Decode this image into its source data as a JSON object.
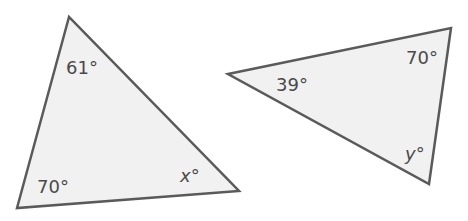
{
  "colors": {
    "stroke": "#5a5a5a",
    "fill": "#f1f1f1",
    "text": "#4a4a4a"
  },
  "triangles": [
    {
      "name": "left-triangle",
      "points": "69,17 17,208 239,191",
      "angles": [
        {
          "label": "61°",
          "vertex": "top"
        },
        {
          "label": "70°",
          "vertex": "bottom-left"
        },
        {
          "label": "x°",
          "vertex": "bottom-right",
          "variable": true
        }
      ]
    },
    {
      "name": "right-triangle",
      "points": "228,74 451,28 429,184",
      "angles": [
        {
          "label": "39°",
          "vertex": "left"
        },
        {
          "label": "70°",
          "vertex": "top-right"
        },
        {
          "label": "y°",
          "vertex": "bottom",
          "variable": true
        }
      ]
    }
  ]
}
